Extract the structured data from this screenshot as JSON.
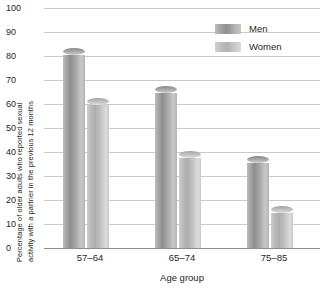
{
  "chart_data": {
    "type": "bar",
    "title": "",
    "subtitle": "",
    "categories": [
      "57–64",
      "65–74",
      "75–85"
    ],
    "series": [
      {
        "name": "Men",
        "values": [
          82,
          66,
          37
        ]
      },
      {
        "name": "Women",
        "values": [
          61,
          39,
          16
        ]
      }
    ],
    "xlabel": "Age group",
    "ylabel_line1": "Percentage of older adults who reported sexual",
    "ylabel_line2": "activity with a partner in the previous 12 months",
    "ylim": [
      0,
      100
    ],
    "ytick_step": 10,
    "yticks": [
      "0",
      "10",
      "20",
      "30",
      "40",
      "50",
      "60",
      "70",
      "80",
      "90",
      "100"
    ],
    "grid": true,
    "legend_position": "top-right",
    "colors": {
      "men": "#8f8f8f",
      "women": "#c0c0c0",
      "grid": "#c9c9c9",
      "axis": "#8d8d8d",
      "text": "#231f20"
    }
  },
  "legend": {
    "entries": [
      {
        "label": "Men"
      },
      {
        "label": "Women"
      }
    ]
  }
}
